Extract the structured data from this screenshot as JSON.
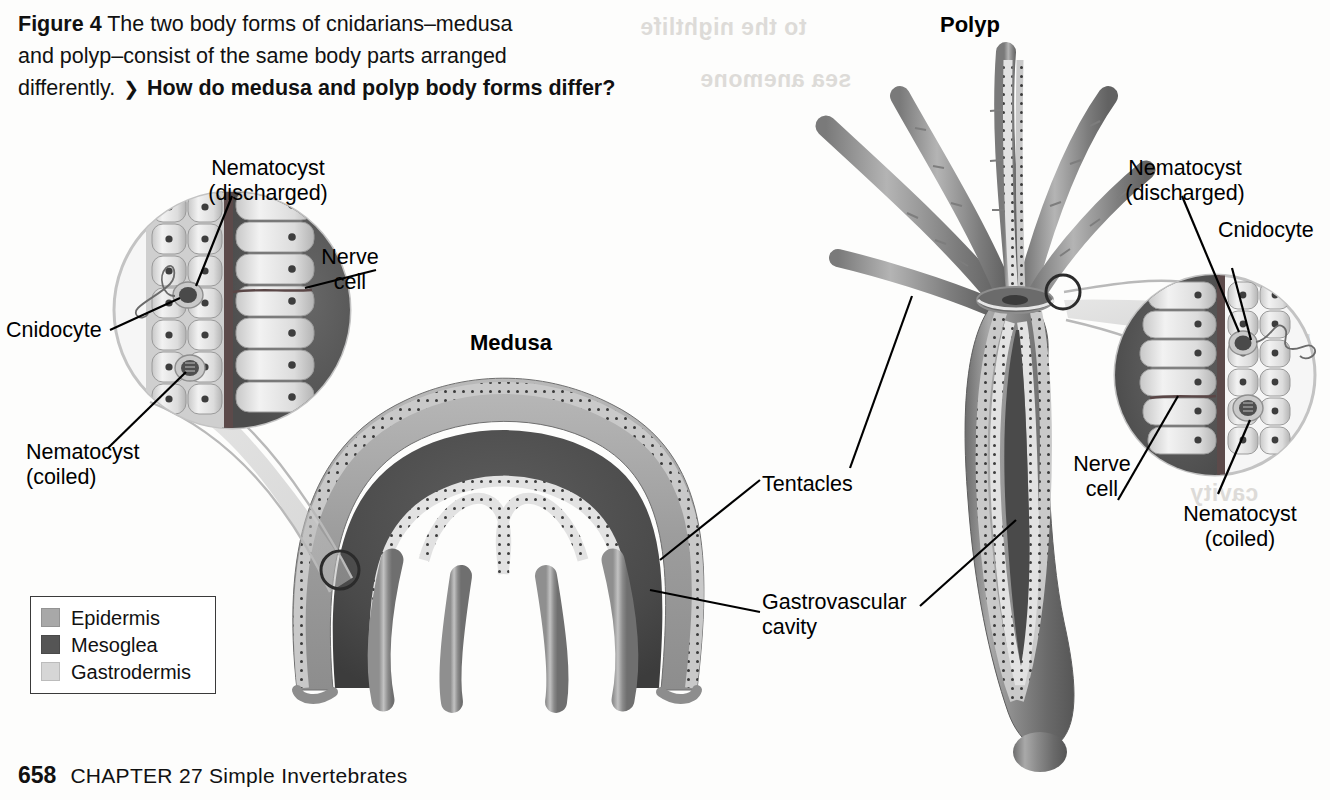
{
  "figure": {
    "label": "Figure 4",
    "caption_line1": "The two body forms of cnidarians–medusa",
    "caption_line2": "and polyp–consist of the same body parts arranged",
    "caption_line3": "differently.",
    "question_arrow": "❯",
    "question": "How do medusa and polyp body forms differ?"
  },
  "titles": {
    "medusa": "Medusa",
    "polyp": "Polyp"
  },
  "left_inset": {
    "nematocyst_discharged": "Nematocyst\n(discharged)",
    "nerve_cell": "Nerve\ncell",
    "cnidocyte": "Cnidocyte",
    "nematocyst_coiled": "Nematocyst\n(coiled)"
  },
  "right_inset": {
    "nematocyst_discharged": "Nematocyst\n(discharged)",
    "cnidocyte": "Cnidocyte",
    "nerve_cell": "Nerve\ncell",
    "nematocyst_coiled": "Nematocyst\n(coiled)"
  },
  "center_labels": {
    "tentacles": "Tentacles",
    "gastrovascular_cavity": "Gastrovascular\ncavity"
  },
  "legend": {
    "items": [
      {
        "label": "Epidermis",
        "color": "#a8a8a8"
      },
      {
        "label": "Mesoglea",
        "color": "#555555"
      },
      {
        "label": "Gastrodermis",
        "color": "#d6d6d6"
      }
    ]
  },
  "footer": {
    "page": "658",
    "chapter": "CHAPTER 27  Simple Invertebrates"
  },
  "ghost_text": {
    "g1": "to the nightlife",
    "g2": "cavity",
    "g3": "EPIDERMIS",
    "g4": "sea anemone"
  },
  "colors": {
    "epidermis": "#a8a8a8",
    "mesoglea": "#555555",
    "gastrodermis": "#d6d6d6",
    "ink": "#000000",
    "paper": "#fdfdfc"
  }
}
